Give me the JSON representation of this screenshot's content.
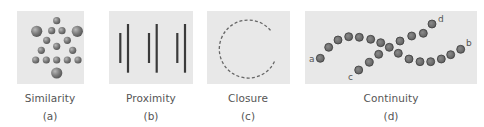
{
  "figure": {
    "panels": [
      {
        "id": "a",
        "caption": "Similarity",
        "sublabel": "(a)"
      },
      {
        "id": "b",
        "caption": "Proximity",
        "sublabel": "(b)"
      },
      {
        "id": "c",
        "caption": "Closure",
        "sublabel": "(c)"
      },
      {
        "id": "d",
        "caption": "Continuity",
        "sublabel": "(d)",
        "point_labels": {
          "a": "a",
          "b": "b",
          "c": "c",
          "d": "d"
        }
      }
    ],
    "colors": {
      "panel_bg": "#e8e8e8",
      "dot_fill": "#7a7a7a",
      "dot_dark": "#5e5e5e",
      "line": "#3a3a3a",
      "caption": "#555555"
    }
  }
}
